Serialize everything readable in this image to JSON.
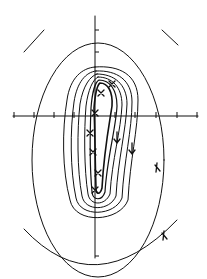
{
  "diagram": {
    "type": "contour-plot",
    "colors": {
      "ink": "#111111",
      "background": "#ffffff"
    },
    "axes": {
      "horizontal": {
        "y": 116,
        "x_start": 13,
        "x_end": 198,
        "ticks_x": [
          13,
          34,
          54,
          74,
          95,
          115,
          135,
          156,
          177,
          198
        ]
      },
      "vertical": {
        "x": 95,
        "y_start": 16,
        "y_end": 86,
        "ticks_y": [
          30,
          52
        ]
      },
      "lower_vertical": {
        "x": 95,
        "y_start": 190,
        "y_end": 258
      }
    },
    "contours": {
      "count": 9,
      "outer_ellipse": {
        "cx": 98,
        "cy": 160,
        "rx": 66,
        "ry": 117
      },
      "outer_arc_bottom": "lower partial circle arc",
      "outer_arc_top": "two short upper arc segments"
    },
    "data_points": [
      {
        "marker": "x",
        "x": 112,
        "y": 84
      },
      {
        "marker": "x",
        "x": 101,
        "y": 93
      },
      {
        "marker": "x",
        "x": 95,
        "y": 113
      },
      {
        "marker": "x",
        "x": 90,
        "y": 133
      },
      {
        "marker": "x",
        "x": 93,
        "y": 152
      },
      {
        "marker": "x",
        "x": 98,
        "y": 173
      },
      {
        "marker": "x",
        "x": 95,
        "y": 190
      }
    ],
    "arrow_marks": [
      {
        "x": 117,
        "y": 137
      },
      {
        "x": 132,
        "y": 148
      },
      {
        "x": 157,
        "y": 168
      },
      {
        "x": 164,
        "y": 236
      }
    ]
  }
}
